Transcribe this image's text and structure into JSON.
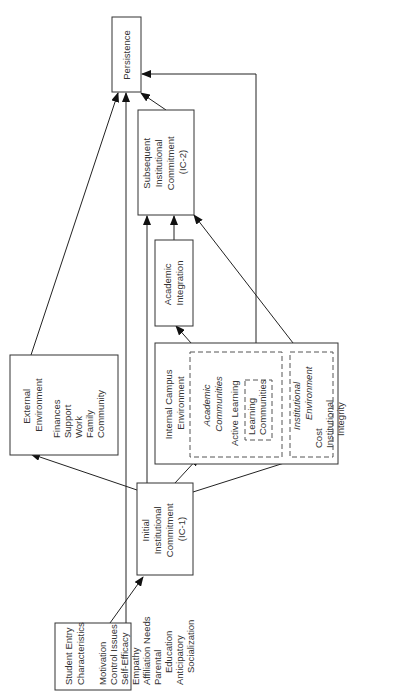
{
  "diagram": {
    "orientation": "rotated-90-ccw",
    "nodes": {
      "student_entry": {
        "title": [
          "Student Entry",
          "Characteristics"
        ],
        "items": [
          "Motivation",
          "Control Issues",
          "Self-Efficacy",
          "Empathy",
          "Affiliation Needs",
          "Parental",
          "Education",
          "Anticipatory",
          "Socialization"
        ]
      },
      "ic1": {
        "lines": [
          "Initial",
          "Institutional",
          "Commitment",
          "(IC-1)"
        ]
      },
      "external": {
        "title": [
          "External",
          "Environment"
        ],
        "items": [
          "Finances",
          "Support",
          "Work",
          "Family",
          "Community"
        ]
      },
      "internal": {
        "title": [
          "Internal Campus",
          "Environment"
        ],
        "academic_communities": {
          "title": [
            "Academic",
            "Communities"
          ],
          "items": [
            "Active Learning"
          ],
          "learning_communities": [
            "Learning",
            "Communities"
          ]
        },
        "institutional_environment": {
          "title": [
            "Institutional",
            "Environment"
          ],
          "items": [
            "Cost",
            "Institutional",
            "Integrity",
            "Institutional",
            "Commitment to",
            "Student Welfare"
          ]
        }
      },
      "academic_integration": {
        "lines": [
          "Academic",
          "Integration"
        ]
      },
      "ic2": {
        "lines": [
          "Subsequent",
          "Institutional",
          "Commitment",
          "(IC-2)"
        ]
      },
      "persistence": {
        "lines": [
          "Persistence"
        ]
      }
    },
    "edges": [
      {
        "from": "Student Entry Characteristics",
        "to": "Initial Institutional Commitment (IC-1)"
      },
      {
        "from": "Student Entry Characteristics",
        "to": "Persistence"
      },
      {
        "from": "Initial Institutional Commitment (IC-1)",
        "to": "External Environment"
      },
      {
        "from": "Initial Institutional Commitment (IC-1)",
        "to": "Academic Communities"
      },
      {
        "from": "Initial Institutional Commitment (IC-1)",
        "to": "Institutional Environment"
      },
      {
        "from": "Initial Institutional Commitment (IC-1)",
        "to": "Subsequent Institutional Commitment (IC-2)"
      },
      {
        "from": "External Environment",
        "to": "Persistence"
      },
      {
        "from": "Academic Communities",
        "to": "Academic Integration"
      },
      {
        "from": "Learning Communities",
        "to": "Persistence"
      },
      {
        "from": "Institutional Environment",
        "to": "Subsequent Institutional Commitment (IC-2)"
      },
      {
        "from": "Academic Integration",
        "to": "Subsequent Institutional Commitment (IC-2)"
      },
      {
        "from": "Subsequent Institutional Commitment (IC-2)",
        "to": "Persistence"
      }
    ]
  }
}
